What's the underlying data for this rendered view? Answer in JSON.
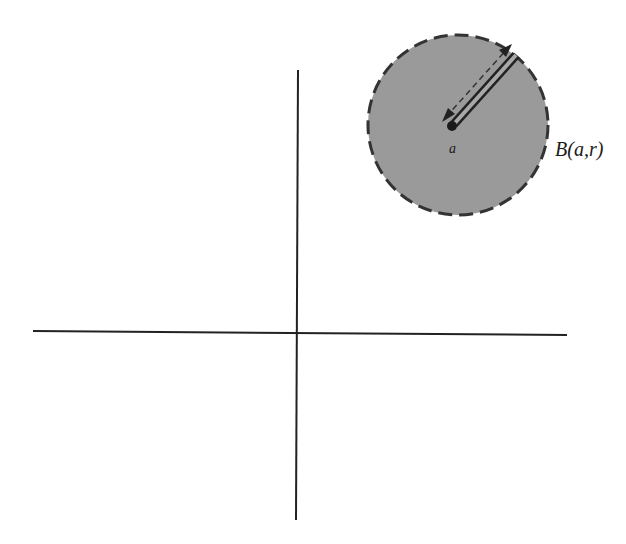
{
  "figure": {
    "ball_label": "B(a,r)",
    "center_label": "a",
    "colors": {
      "background": "#ffffff",
      "ball_fill": "#9a9a9a",
      "ball_outline": "#333333",
      "axis": "#222222",
      "radius_arrow": "#222222"
    },
    "axes": {
      "horizontal": {
        "x1": 33,
        "y1": 331,
        "x2": 567,
        "y2": 335
      },
      "vertical": {
        "x1": 298,
        "y1": 70,
        "x2": 296,
        "y2": 520
      }
    },
    "ball": {
      "cx": 458,
      "cy": 125,
      "r": 90,
      "outline_style": "dashed"
    },
    "center_point": {
      "cx": 452,
      "cy": 126
    },
    "radius_segment": {
      "x1": 452,
      "y1": 126,
      "x2": 515,
      "y2": 56
    }
  }
}
